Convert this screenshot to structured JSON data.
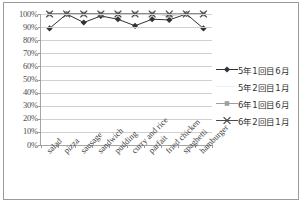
{
  "chart_data": {
    "type": "line",
    "title": "",
    "xlabel": "",
    "ylabel": "",
    "ylim": [
      0,
      100
    ],
    "y_unit": "%",
    "grid": true,
    "legend_position": "right",
    "categories": [
      "salad",
      "pizza",
      "sausage",
      "sandwich",
      "pudding",
      "curry and rice",
      "parfait",
      "fried chicken",
      "spaghetti",
      "hamburger"
    ],
    "y_ticks": [
      "0%",
      "10%",
      "20%",
      "30%",
      "40%",
      "50%",
      "60%",
      "70%",
      "80%",
      "90%",
      "100%"
    ],
    "y_tick_values": [
      0,
      10,
      20,
      30,
      40,
      50,
      60,
      70,
      80,
      90,
      100
    ],
    "series": [
      {
        "name": "5年1回目6月",
        "marker": "diamond",
        "color": "#333333",
        "values": [
          89,
          100,
          93.5,
          98.5,
          96,
          91,
          96,
          95.5,
          100,
          89
        ]
      },
      {
        "name": "5年2回目1月",
        "marker": "none",
        "color": "#f2f2f2",
        "values": [
          100,
          100,
          100,
          100,
          100,
          100,
          100,
          100,
          100,
          100
        ]
      },
      {
        "name": "6年1回目6月",
        "marker": "square",
        "color": "#9e9e9e",
        "values": [
          100,
          100,
          100,
          100,
          100,
          100,
          100,
          99,
          100,
          100
        ]
      },
      {
        "name": "6年2回目1月",
        "marker": "cross",
        "color": "#4a4a4a",
        "values": [
          100,
          100,
          100,
          100,
          100,
          100,
          100,
          100,
          100,
          100
        ]
      }
    ]
  },
  "legend": {
    "items": [
      {
        "label": "5年1回目6月"
      },
      {
        "label": "5年2回目1月"
      },
      {
        "label": "6年1回目6月"
      },
      {
        "label": "6年2回目1月"
      }
    ]
  },
  "colors": {
    "frame_border": "#9a9a9a",
    "gridline": "#d0d0d0",
    "axis": "#a6a6a6",
    "background": "#ffffff"
  }
}
